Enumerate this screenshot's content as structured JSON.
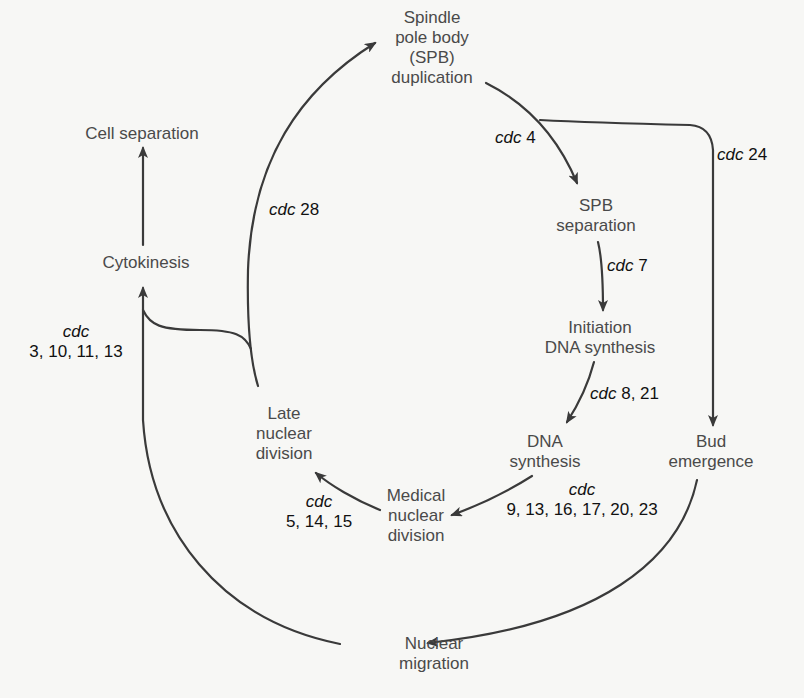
{
  "diagram": {
    "type": "cell-cycle-pathway",
    "stages": {
      "spb_duplication": "Spindle\npole body\n(SPB)\nduplication",
      "spb_separation": "SPB\nseparation",
      "initiation_dna": "Initiation\nDNA synthesis",
      "dna_synthesis": "DNA\nsynthesis",
      "bud_emergence": "Bud\nemergence",
      "medial_nuclear_division": "Medical\nnuclear\ndivision",
      "late_nuclear_division": "Late\nnuclear\ndivision",
      "nuclear_migration": "Nuclear\nmigration",
      "cytokinesis": "Cytokinesis",
      "cell_separation": "Cell separation"
    },
    "genes": {
      "prefix": "cdc",
      "cdc4": " 4",
      "cdc24": " 24",
      "cdc28": " 28",
      "cdc7": " 7",
      "cdc8_21": " 8, 21",
      "dna_synthesis_genes": "9, 13, 16, 17, 20, 23",
      "medial_genes": "5, 14, 15",
      "cytokinesis_genes": "3, 10, 11, 13"
    },
    "line_color": "#3a3a3a"
  }
}
